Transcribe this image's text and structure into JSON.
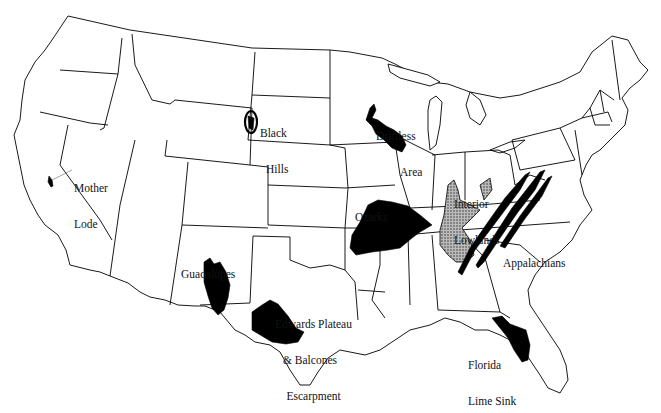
{
  "map": {
    "title": "",
    "subject": "Karst regions of the contiguous United States",
    "colors": {
      "background": "#ffffff",
      "state_outline": "#000000",
      "karst_fill": "#000000",
      "interior_lowlands_fill": "stippled-gray"
    },
    "labels": [
      {
        "id": "mother-lode",
        "lines": [
          "Mother",
          "Lode"
        ],
        "x": 74,
        "y": 158
      },
      {
        "id": "black-hills",
        "lines": [
          "Black",
          "Hills"
        ],
        "x": 260,
        "y": 103
      },
      {
        "id": "driftless-area",
        "lines": [
          "Driftless",
          "Area"
        ],
        "x": 376,
        "y": 106
      },
      {
        "id": "ozarks",
        "lines": [
          "Ozarks"
        ],
        "x": 355,
        "y": 187
      },
      {
        "id": "interior-lowlands",
        "lines": [
          "Interior",
          "Lowlands"
        ],
        "x": 454,
        "y": 174
      },
      {
        "id": "appalachians",
        "lines": [
          "Appalachians"
        ],
        "x": 503,
        "y": 233
      },
      {
        "id": "guadalupes",
        "lines": [
          "Guadalupes"
        ],
        "x": 181,
        "y": 244
      },
      {
        "id": "edwards-plateau",
        "lines": [
          "Edwards Plateau",
          "& Balcones",
          "    Escarpment"
        ],
        "x": 275,
        "y": 294
      },
      {
        "id": "florida-lime-sink",
        "lines": [
          "Florida",
          "Lime Sink"
        ],
        "x": 468,
        "y": 335
      }
    ]
  }
}
